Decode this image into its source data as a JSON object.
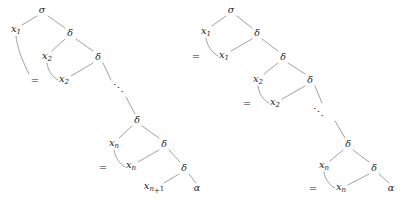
{
  "figure": {
    "kind": "derivation-tree-pair",
    "background_color": "#ffffff",
    "ink_color": "#1d1d1d",
    "edge_color": "#8a8a8a",
    "ellipsis_glyph": "⋱"
  },
  "trees": [
    {
      "id": "left-tree",
      "name": "left-derivation-tree",
      "root_label": "σ",
      "nodes": [
        {
          "id": "l-root",
          "name": "node-sigma",
          "text": "σ",
          "kind": "greek",
          "x": 42,
          "y": 10
        },
        {
          "id": "l-x1",
          "name": "node-x1",
          "text": "x",
          "sub": "1",
          "kind": "var",
          "x": 16,
          "y": 30
        },
        {
          "id": "l-d1",
          "name": "node-delta-1",
          "text": "δ",
          "kind": "greek",
          "x": 70,
          "y": 33
        },
        {
          "id": "l-x2a",
          "name": "node-x2-upper",
          "text": "x",
          "sub": "2",
          "kind": "var",
          "x": 47,
          "y": 57
        },
        {
          "id": "l-d2",
          "name": "node-delta-2",
          "text": "δ",
          "kind": "greek",
          "x": 98,
          "y": 57
        },
        {
          "id": "l-eq1",
          "name": "equals-sign-1",
          "text": "=",
          "kind": "eq",
          "x": 35,
          "y": 81
        },
        {
          "id": "l-x2b",
          "name": "node-x2-lower",
          "text": "x",
          "sub": "2",
          "kind": "var",
          "x": 64,
          "y": 80
        },
        {
          "id": "l-d3",
          "name": "node-delta-3",
          "text": "δ",
          "kind": "greek",
          "x": 137,
          "y": 120
        },
        {
          "id": "l-xna",
          "name": "node-xn-upper",
          "text": "x",
          "sub": "n",
          "kind": "var",
          "x": 114,
          "y": 144
        },
        {
          "id": "l-d4",
          "name": "node-delta-4",
          "text": "δ",
          "kind": "greek",
          "x": 164,
          "y": 144
        },
        {
          "id": "l-eq2",
          "name": "equals-sign-2",
          "text": "=",
          "kind": "eq",
          "x": 103,
          "y": 168
        },
        {
          "id": "l-xnb",
          "name": "node-xn-lower",
          "text": "x",
          "sub": "n",
          "kind": "var",
          "x": 131,
          "y": 166
        },
        {
          "id": "l-d5",
          "name": "node-delta-5",
          "text": "δ",
          "kind": "greek",
          "x": 184,
          "y": 168
        },
        {
          "id": "l-xn1",
          "name": "node-xn-plus-1",
          "text": "x",
          "sub": "n+1",
          "kind": "var",
          "x": 154,
          "y": 188
        },
        {
          "id": "l-alpha",
          "name": "node-alpha",
          "text": "α",
          "kind": "greek",
          "x": 197,
          "y": 188
        }
      ],
      "ellipsis": {
        "name": "ellipsis-left",
        "x": 118,
        "y": 88
      },
      "edges": [
        {
          "name": "edge-sigma-x1",
          "x1": 37,
          "y1": 16,
          "x2": 22,
          "y2": 25
        },
        {
          "name": "edge-sigma-d1",
          "x1": 48,
          "y1": 16,
          "x2": 65,
          "y2": 28
        },
        {
          "name": "edge-d1-x2",
          "x1": 65,
          "y1": 39,
          "x2": 52,
          "y2": 51
        },
        {
          "name": "edge-d1-d2",
          "x1": 76,
          "y1": 39,
          "x2": 93,
          "y2": 51
        },
        {
          "name": "edge-d2-x2b",
          "x1": 93,
          "y1": 63,
          "x2": 71,
          "y2": 76
        },
        {
          "name": "edge-d3-xn",
          "x1": 132,
          "y1": 126,
          "x2": 119,
          "y2": 138
        },
        {
          "name": "edge-d3-d4",
          "x1": 142,
          "y1": 126,
          "x2": 159,
          "y2": 138
        },
        {
          "name": "edge-d4-xnb",
          "x1": 159,
          "y1": 150,
          "x2": 138,
          "y2": 162
        },
        {
          "name": "edge-d4-d5",
          "x1": 169,
          "y1": 150,
          "x2": 180,
          "y2": 162
        },
        {
          "name": "edge-d5-xn1",
          "x1": 179,
          "y1": 174,
          "x2": 164,
          "y2": 183
        },
        {
          "name": "edge-d5-alpha",
          "x1": 189,
          "y1": 174,
          "x2": 196,
          "y2": 183
        },
        {
          "name": "edge-d2-ellipsis",
          "x1": 103,
          "y1": 63,
          "x2": 111,
          "y2": 80
        },
        {
          "name": "edge-ellipsis-d3",
          "x1": 126,
          "y1": 97,
          "x2": 135,
          "y2": 114
        }
      ],
      "hooks": [
        {
          "name": "hook-x1-equals",
          "d": "M 16 36 C 17 46, 21 58, 29 74"
        },
        {
          "name": "hook-x2-equals",
          "d": "M 47 63 C 48 70, 51 76, 58 80"
        },
        {
          "name": "hook-xn-equals",
          "d": "M 114 150 C 115 157, 119 163, 125 167"
        }
      ]
    },
    {
      "id": "right-tree",
      "name": "right-derivation-tree",
      "root_label": "σ",
      "nodes": [
        {
          "id": "r-root",
          "name": "node-sigma",
          "text": "σ",
          "kind": "greek",
          "x": 231,
          "y": 10
        },
        {
          "id": "r-x1a",
          "name": "node-x1-upper",
          "text": "x",
          "sub": "1",
          "kind": "var",
          "x": 206,
          "y": 32
        },
        {
          "id": "r-d1",
          "name": "node-delta-1",
          "text": "δ",
          "kind": "greek",
          "x": 257,
          "y": 33
        },
        {
          "id": "r-eq1",
          "name": "equals-sign-1",
          "text": "=",
          "kind": "eq",
          "x": 196,
          "y": 57
        },
        {
          "id": "r-x1b",
          "name": "node-x1-lower",
          "text": "x",
          "sub": "1",
          "kind": "var",
          "x": 224,
          "y": 56
        },
        {
          "id": "r-d2",
          "name": "node-delta-2",
          "text": "δ",
          "kind": "greek",
          "x": 283,
          "y": 57
        },
        {
          "id": "r-x2a",
          "name": "node-x2-upper",
          "text": "x",
          "sub": "2",
          "kind": "var",
          "x": 258,
          "y": 80
        },
        {
          "id": "r-d3",
          "name": "node-delta-3",
          "text": "δ",
          "kind": "greek",
          "x": 310,
          "y": 80
        },
        {
          "id": "r-eq2",
          "name": "equals-sign-2",
          "text": "=",
          "kind": "eq",
          "x": 247,
          "y": 104
        },
        {
          "id": "r-x2b",
          "name": "node-x2-lower",
          "text": "x",
          "sub": "2",
          "kind": "var",
          "x": 275,
          "y": 103
        },
        {
          "id": "r-d4",
          "name": "node-delta-4",
          "text": "δ",
          "kind": "greek",
          "x": 348,
          "y": 144
        },
        {
          "id": "r-xna",
          "name": "node-xn-upper",
          "text": "x",
          "sub": "n",
          "kind": "var",
          "x": 324,
          "y": 166
        },
        {
          "id": "r-d5",
          "name": "node-delta-5",
          "text": "δ",
          "kind": "greek",
          "x": 374,
          "y": 168
        },
        {
          "id": "r-eq3",
          "name": "equals-sign-3",
          "text": "=",
          "kind": "eq",
          "x": 313,
          "y": 189
        },
        {
          "id": "r-xnb",
          "name": "node-xn-lower",
          "text": "x",
          "sub": "n",
          "kind": "var",
          "x": 341,
          "y": 188
        },
        {
          "id": "r-alpha",
          "name": "node-alpha",
          "text": "α",
          "kind": "greek",
          "x": 391,
          "y": 188
        }
      ],
      "ellipsis": {
        "name": "ellipsis-right",
        "x": 318,
        "y": 112
      },
      "edges": [
        {
          "name": "edge-sigma-x1",
          "x1": 226,
          "y1": 16,
          "x2": 212,
          "y2": 26
        },
        {
          "name": "edge-sigma-d1",
          "x1": 237,
          "y1": 16,
          "x2": 252,
          "y2": 28
        },
        {
          "name": "edge-d1-x1b",
          "x1": 252,
          "y1": 39,
          "x2": 231,
          "y2": 51
        },
        {
          "name": "edge-d1-d2",
          "x1": 262,
          "y1": 39,
          "x2": 278,
          "y2": 51
        },
        {
          "name": "edge-d2-x2a",
          "x1": 278,
          "y1": 63,
          "x2": 264,
          "y2": 74
        },
        {
          "name": "edge-d2-d3",
          "x1": 288,
          "y1": 63,
          "x2": 305,
          "y2": 74
        },
        {
          "name": "edge-d3-x2b",
          "x1": 305,
          "y1": 86,
          "x2": 282,
          "y2": 99
        },
        {
          "name": "edge-d3-ellipsis",
          "x1": 315,
          "y1": 86,
          "x2": 322,
          "y2": 103
        },
        {
          "name": "edge-ellipsis-d4",
          "x1": 335,
          "y1": 121,
          "x2": 345,
          "y2": 138
        },
        {
          "name": "edge-d4-xn",
          "x1": 343,
          "y1": 150,
          "x2": 330,
          "y2": 161
        },
        {
          "name": "edge-d4-d5",
          "x1": 353,
          "y1": 150,
          "x2": 369,
          "y2": 162
        },
        {
          "name": "edge-d5-xnb",
          "x1": 369,
          "y1": 174,
          "x2": 348,
          "y2": 185
        },
        {
          "name": "edge-d5-alpha",
          "x1": 379,
          "y1": 174,
          "x2": 389,
          "y2": 183
        }
      ],
      "hooks": [
        {
          "name": "hook-x1-equals",
          "d": "M 206 38 C 207 45, 211 52, 218 56"
        },
        {
          "name": "hook-x2-equals",
          "d": "M 258 86 C 259 93, 262 99, 269 103"
        },
        {
          "name": "hook-xn-equals",
          "d": "M 324 172 C 325 179, 329 185, 335 188"
        }
      ]
    }
  ]
}
